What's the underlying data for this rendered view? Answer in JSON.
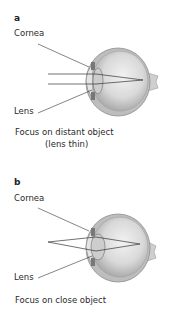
{
  "panels": [
    {
      "letter": "a",
      "labels": {
        "cornea": "Cornea",
        "lens": "Lens"
      },
      "caption": {
        "line1": "Focus on distant object",
        "line2": "(lens thin)"
      },
      "rays": "parallel",
      "lens_state": "thin"
    },
    {
      "letter": "b",
      "labels": {
        "cornea": "Cornea",
        "lens": "Lens"
      },
      "caption": {
        "line1": "Focus on close object"
      },
      "rays": "diverging",
      "lens_state": "thick"
    }
  ],
  "colors": {
    "background": "#ffffff",
    "text": "#2a2a2a",
    "eyeball": "#d8d8d8",
    "sclera_outline": "#9a9a9a",
    "lens": "#c4c4c4",
    "ray": "#333333"
  }
}
